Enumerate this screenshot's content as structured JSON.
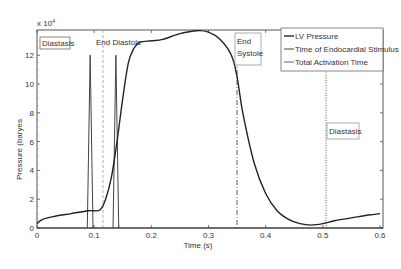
{
  "chart_data": {
    "type": "line",
    "title": "",
    "xlabel": "Time (s)",
    "ylabel": "Pressure (baryes",
    "y_multiplier": "x 10^4",
    "xlim": [
      0,
      0.6
    ],
    "ylim": [
      0,
      13.8
    ],
    "x_ticks": [
      "0",
      "0.1",
      "0.2",
      "0.3",
      "0.4",
      "0.5",
      "0.6"
    ],
    "y_ticks": [
      "0",
      "2",
      "4",
      "6",
      "8",
      "10",
      "12"
    ],
    "grid": false,
    "legend_position": "upper right",
    "legend": [
      "LV Pressure",
      "Time of Endocardial Stimulus",
      "Total Activation Time"
    ],
    "series": [
      {
        "name": "LV Pressure",
        "x": [
          0,
          0.01,
          0.03,
          0.06,
          0.09,
          0.11,
          0.12,
          0.13,
          0.14,
          0.15,
          0.16,
          0.17,
          0.18,
          0.2,
          0.22,
          0.25,
          0.28,
          0.3,
          0.32,
          0.34,
          0.35,
          0.36,
          0.38,
          0.4,
          0.42,
          0.44,
          0.46,
          0.48,
          0.5,
          0.52,
          0.55,
          0.58,
          0.6
        ],
        "values": [
          0.3,
          0.6,
          0.8,
          1.0,
          1.2,
          1.25,
          2.0,
          3.5,
          6.0,
          9.0,
          11.5,
          12.5,
          12.9,
          13.0,
          13.1,
          13.5,
          13.7,
          13.6,
          13.1,
          12.0,
          10.5,
          8.0,
          4.5,
          2.4,
          1.2,
          0.6,
          0.3,
          0.2,
          0.3,
          0.5,
          0.7,
          0.9,
          1.0
        ]
      },
      {
        "name": "Time of Endocardial Stimulus",
        "spikes": [
          {
            "t_start": 0.088,
            "t_peak": 0.093,
            "t_end": 0.098,
            "peak": 12.0
          },
          {
            "t_start": 0.133,
            "t_peak": 0.138,
            "t_end": 0.143,
            "peak": 12.0
          }
        ]
      },
      {
        "name": "Total Activation Time",
        "vlines": [
          0.098,
          0.143
        ]
      }
    ],
    "annotations": [
      {
        "text": "Diastasis",
        "x": 0.005,
        "boxed": true
      },
      {
        "text": "End Diastole",
        "x": 0.115,
        "line": "dashed"
      },
      {
        "text": "End Systole",
        "x": 0.35,
        "line": "dash-dot",
        "boxed": true
      },
      {
        "text": "Diastasis",
        "x": 0.505,
        "line": "dotted",
        "boxed": true
      }
    ]
  },
  "labels": {
    "multiplier": "x 10",
    "multiplier_exp": "4",
    "xlabel": "Time (s)",
    "ylabel": "Pressure (baryes",
    "ann_diastasis_left": "Diastasis",
    "ann_end_diastole": "End Diastole",
    "ann_end_systole_1": "End",
    "ann_end_systole_2": "Systole",
    "ann_diastasis_right": "Diastasis",
    "legend_1": "LV Pressure",
    "legend_2": "Time of Endocardial Stimulus",
    "legend_3": "Total Activation Time"
  }
}
